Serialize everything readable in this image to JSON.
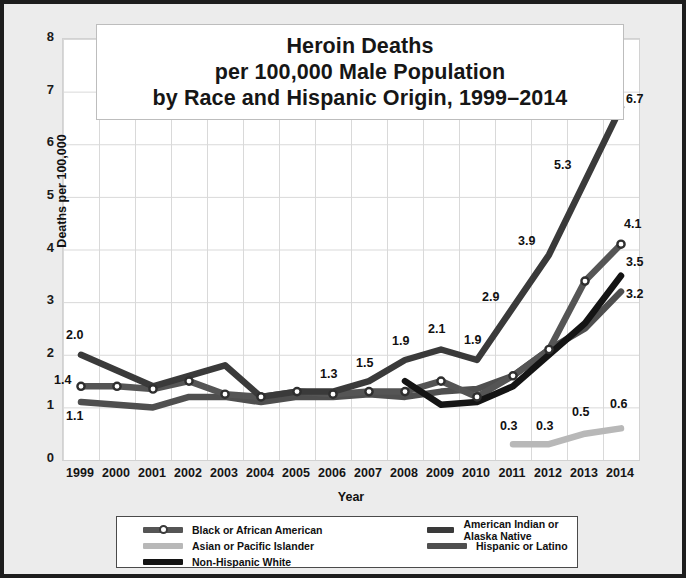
{
  "title": {
    "line1": "Heroin Deaths",
    "line2": "per 100,000 Male Population",
    "line3": "by Race and Hispanic Origin, 1999–2014"
  },
  "axes": {
    "ylabel": "Deaths per 100,000",
    "xlabel": "Year",
    "yticks": [
      "0",
      "1",
      "2",
      "3",
      "4",
      "5",
      "6",
      "7",
      "8"
    ],
    "xticks": [
      "1999",
      "2000",
      "2001",
      "2002",
      "2003",
      "2004",
      "2005",
      "2006",
      "2007",
      "2008",
      "2009",
      "2010",
      "2011",
      "2012",
      "2013",
      "2014"
    ]
  },
  "legend": {
    "items": [
      {
        "label": "Black or African American",
        "color": "#555555",
        "marker": "circle"
      },
      {
        "label": "Asian or Pacific Islander",
        "color": "#b8b8b8",
        "marker": "none"
      },
      {
        "label": "Non-Hispanic White",
        "color": "#141414",
        "marker": "none"
      },
      {
        "label": "American Indian or Alaska Native",
        "color": "#3a3a3a",
        "marker": "none"
      },
      {
        "label": "Hispanic or Latino",
        "color": "#4f4f4f",
        "marker": "none"
      }
    ]
  },
  "chart_data": {
    "type": "line",
    "title": "Heroin Deaths per 100,000 Male Population by Race and Hispanic Origin, 1999–2014",
    "xlabel": "Year",
    "ylabel": "Deaths per 100,000",
    "ylim": [
      0,
      8
    ],
    "grid": true,
    "legend_position": "bottom",
    "x": [
      1999,
      2000,
      2001,
      2002,
      2003,
      2004,
      2005,
      2006,
      2007,
      2008,
      2009,
      2010,
      2011,
      2012,
      2013,
      2014
    ],
    "series": [
      {
        "name": "American Indian or Alaska Native",
        "color": "#3a3a3a",
        "values": [
          2.0,
          1.7,
          1.4,
          1.6,
          1.8,
          1.2,
          1.3,
          1.3,
          1.5,
          1.9,
          2.1,
          1.9,
          2.9,
          3.9,
          5.3,
          6.7
        ],
        "labels": [
          {
            "x": 1999,
            "text": "2.0"
          },
          {
            "x": 2006,
            "text": "1.3"
          },
          {
            "x": 2007,
            "text": "1.5"
          },
          {
            "x": 2008,
            "text": "1.9"
          },
          {
            "x": 2009,
            "text": "2.1"
          },
          {
            "x": 2010,
            "text": "1.9"
          },
          {
            "x": 2011,
            "text": "2.9"
          },
          {
            "x": 2012,
            "text": "3.9"
          },
          {
            "x": 2013,
            "text": "5.3"
          },
          {
            "x": 2014,
            "text": "6.7"
          }
        ]
      },
      {
        "name": "Black or African American",
        "color": "#555555",
        "marker": "circle",
        "values": [
          1.4,
          1.4,
          1.35,
          1.5,
          1.25,
          1.2,
          1.3,
          1.25,
          1.3,
          1.3,
          1.5,
          1.2,
          1.6,
          2.1,
          3.4,
          4.1
        ],
        "labels": [
          {
            "x": 1999,
            "text": "1.4"
          },
          {
            "x": 2014,
            "text": "4.1"
          }
        ]
      },
      {
        "name": "Hispanic or Latino",
        "color": "#4f4f4f",
        "values": [
          1.1,
          1.05,
          1.0,
          1.2,
          1.2,
          1.1,
          1.2,
          1.2,
          1.25,
          1.2,
          1.3,
          1.35,
          1.6,
          2.1,
          2.5,
          3.2
        ],
        "labels": [
          {
            "x": 1999,
            "text": "1.1"
          },
          {
            "x": 2014,
            "text": "3.2"
          }
        ]
      },
      {
        "name": "Non-Hispanic White",
        "color": "#141414",
        "start_year": 2008,
        "values": [
          null,
          null,
          null,
          null,
          null,
          null,
          null,
          null,
          null,
          1.5,
          1.05,
          1.1,
          1.4,
          2.0,
          2.6,
          3.5
        ],
        "labels": [
          {
            "x": 2014,
            "text": "3.5"
          }
        ]
      },
      {
        "name": "Asian or Pacific Islander",
        "color": "#b8b8b8",
        "start_year": 2011,
        "values": [
          null,
          null,
          null,
          null,
          null,
          null,
          null,
          null,
          null,
          null,
          null,
          null,
          0.3,
          0.3,
          0.5,
          0.6
        ],
        "labels": [
          {
            "x": 2011,
            "text": "0.3"
          },
          {
            "x": 2012,
            "text": "0.3"
          },
          {
            "x": 2013,
            "text": "0.5"
          },
          {
            "x": 2014,
            "text": "0.6"
          }
        ]
      }
    ]
  }
}
